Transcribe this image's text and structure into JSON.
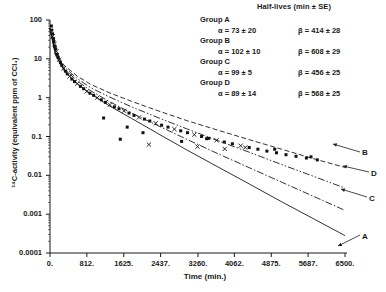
{
  "chart_data": {
    "type": "scatter",
    "title": "",
    "xlabel": "Time (min.)",
    "ylabel": "14C-activity (equivalent ppm of CCl4)",
    "ylabel_display": "¹⁴C-activity (equivalent ppm of CCl₄)",
    "yscale": "log",
    "xscale": "linear",
    "xlim": [
      0,
      6500
    ],
    "ylim": [
      0.0001,
      100
    ],
    "grid": false,
    "legend_position": "top-right",
    "xticks": [
      "0.",
      "812.",
      "1625.",
      "2437.",
      "3260.",
      "4062.",
      "4875.",
      "5687.",
      "6500."
    ],
    "xtick_values": [
      0,
      812,
      1625,
      2437,
      3260,
      4062,
      4875,
      5687,
      6500
    ],
    "yticks": [
      "100",
      "10",
      "1",
      "0.1",
      "0.01",
      "0.001",
      "0.0001"
    ],
    "ytick_values": [
      100,
      10,
      1,
      0.1,
      0.01,
      0.001,
      0.0001
    ],
    "legend_title": "Half-lives (min ± SE)",
    "groups": [
      {
        "name": "Group A",
        "curve_label": "A",
        "line_style": "solid",
        "alpha": "α = 73 ± 20",
        "beta": "β = 414 ± 28",
        "alpha_value": 73,
        "alpha_se": 20,
        "beta_value": 414,
        "beta_se": 28
      },
      {
        "name": "Group B",
        "curve_label": "B",
        "line_style": "dashed",
        "alpha": "α = 102 ± 10",
        "beta": "β = 608 ± 29",
        "alpha_value": 102,
        "alpha_se": 10,
        "beta_value": 608,
        "beta_se": 29
      },
      {
        "name": "Group C",
        "curve_label": "C",
        "line_style": "dash-dot",
        "alpha": "α = 99 ± 5",
        "beta": "β = 456 ± 25",
        "alpha_value": 99,
        "alpha_se": 5,
        "beta_value": 456,
        "beta_se": 25
      },
      {
        "name": "Group D",
        "curve_label": "D",
        "line_style": "dash-dot-dot",
        "alpha": "α = 89 ± 14",
        "beta": "β = 568 ± 25",
        "alpha_value": 89,
        "alpha_se": 14,
        "beta_value": 568,
        "beta_se": 25
      }
    ],
    "series": [
      {
        "name": "Group A fit",
        "label": "A",
        "x": [
          0,
          120,
          300,
          600,
          900,
          1300,
          1800,
          2400,
          3000,
          3700,
          4400,
          5100,
          5800,
          6500
        ],
        "y": [
          60,
          12.5,
          5.2,
          2.3,
          1.25,
          0.62,
          0.29,
          0.115,
          0.046,
          0.0165,
          0.0059,
          0.0021,
          0.00077,
          0.00028
        ]
      },
      {
        "name": "Group B fit",
        "label": "B",
        "x": [
          0,
          120,
          300,
          600,
          900,
          1300,
          1800,
          2400,
          3000,
          3700,
          4400,
          5100,
          5800,
          6500
        ],
        "y": [
          60,
          15,
          7.0,
          3.6,
          2.2,
          1.35,
          0.8,
          0.45,
          0.26,
          0.145,
          0.082,
          0.047,
          0.027,
          0.016
        ]
      },
      {
        "name": "Group C fit",
        "label": "C",
        "x": [
          0,
          120,
          300,
          600,
          900,
          1300,
          1800,
          2400,
          3000,
          3700,
          4400,
          5100,
          5800,
          6500
        ],
        "y": [
          60,
          13.5,
          5.8,
          2.7,
          1.5,
          0.8,
          0.4,
          0.185,
          0.086,
          0.036,
          0.0155,
          0.0067,
          0.0029,
          0.00125
        ]
      },
      {
        "name": "Group D fit",
        "label": "D",
        "x": [
          0,
          120,
          300,
          600,
          900,
          1300,
          1800,
          2400,
          3000,
          3700,
          4400,
          5100,
          5800,
          6500
        ],
        "y": [
          60,
          14,
          6.4,
          3.1,
          1.8,
          1.05,
          0.58,
          0.3,
          0.16,
          0.078,
          0.039,
          0.019,
          0.0095,
          0.0047
        ]
      }
    ],
    "scatter_points": [
      {
        "x": 30,
        "y": 70,
        "marker": "square"
      },
      {
        "x": 40,
        "y": 55,
        "marker": "square"
      },
      {
        "x": 55,
        "y": 44,
        "marker": "square"
      },
      {
        "x": 60,
        "y": 38,
        "marker": "cross"
      },
      {
        "x": 75,
        "y": 33,
        "marker": "square"
      },
      {
        "x": 85,
        "y": 28,
        "marker": "square"
      },
      {
        "x": 100,
        "y": 24,
        "marker": "cross"
      },
      {
        "x": 110,
        "y": 21,
        "marker": "square"
      },
      {
        "x": 125,
        "y": 18,
        "marker": "square"
      },
      {
        "x": 140,
        "y": 15.5,
        "marker": "cross"
      },
      {
        "x": 160,
        "y": 13,
        "marker": "square"
      },
      {
        "x": 180,
        "y": 11,
        "marker": "square"
      },
      {
        "x": 200,
        "y": 9.5,
        "marker": "cross"
      },
      {
        "x": 230,
        "y": 8.0,
        "marker": "square"
      },
      {
        "x": 260,
        "y": 6.8,
        "marker": "square"
      },
      {
        "x": 300,
        "y": 5.6,
        "marker": "cross"
      },
      {
        "x": 340,
        "y": 4.8,
        "marker": "square"
      },
      {
        "x": 380,
        "y": 4.1,
        "marker": "square"
      },
      {
        "x": 430,
        "y": 3.5,
        "marker": "cross"
      },
      {
        "x": 480,
        "y": 3.0,
        "marker": "square"
      },
      {
        "x": 540,
        "y": 2.6,
        "marker": "square"
      },
      {
        "x": 600,
        "y": 2.3,
        "marker": "cross"
      },
      {
        "x": 670,
        "y": 1.95,
        "marker": "square"
      },
      {
        "x": 740,
        "y": 1.7,
        "marker": "square"
      },
      {
        "x": 810,
        "y": 1.45,
        "marker": "cross"
      },
      {
        "x": 880,
        "y": 1.3,
        "marker": "square"
      },
      {
        "x": 960,
        "y": 1.15,
        "marker": "square"
      },
      {
        "x": 1040,
        "y": 1.0,
        "marker": "cross"
      },
      {
        "x": 1130,
        "y": 0.88,
        "marker": "square"
      },
      {
        "x": 1220,
        "y": 0.76,
        "marker": "square"
      },
      {
        "x": 1320,
        "y": 0.66,
        "marker": "cross"
      },
      {
        "x": 1420,
        "y": 0.58,
        "marker": "square"
      },
      {
        "x": 1520,
        "y": 0.52,
        "marker": "square"
      },
      {
        "x": 1630,
        "y": 0.46,
        "marker": "cross"
      },
      {
        "x": 1740,
        "y": 0.4,
        "marker": "square"
      },
      {
        "x": 1850,
        "y": 0.35,
        "marker": "square"
      },
      {
        "x": 1960,
        "y": 0.31,
        "marker": "cross"
      },
      {
        "x": 2080,
        "y": 0.28,
        "marker": "square"
      },
      {
        "x": 2200,
        "y": 0.25,
        "marker": "square"
      },
      {
        "x": 2330,
        "y": 0.22,
        "marker": "cross"
      },
      {
        "x": 2460,
        "y": 0.195,
        "marker": "square"
      },
      {
        "x": 2600,
        "y": 0.175,
        "marker": "square"
      },
      {
        "x": 2740,
        "y": 0.155,
        "marker": "cross"
      },
      {
        "x": 2880,
        "y": 0.14,
        "marker": "square"
      },
      {
        "x": 3030,
        "y": 0.125,
        "marker": "square"
      },
      {
        "x": 3180,
        "y": 0.112,
        "marker": "cross"
      },
      {
        "x": 3340,
        "y": 0.1,
        "marker": "square"
      },
      {
        "x": 3500,
        "y": 0.09,
        "marker": "square"
      },
      {
        "x": 3670,
        "y": 0.08,
        "marker": "cross"
      },
      {
        "x": 3840,
        "y": 0.072,
        "marker": "square"
      },
      {
        "x": 4020,
        "y": 0.065,
        "marker": "square"
      },
      {
        "x": 4200,
        "y": 0.058,
        "marker": "cross"
      },
      {
        "x": 4390,
        "y": 0.052,
        "marker": "square"
      },
      {
        "x": 4580,
        "y": 0.047,
        "marker": "square"
      },
      {
        "x": 4780,
        "y": 0.042,
        "marker": "square"
      },
      {
        "x": 4990,
        "y": 0.038,
        "marker": "square"
      },
      {
        "x": 5200,
        "y": 0.034,
        "marker": "square"
      },
      {
        "x": 5420,
        "y": 0.031,
        "marker": "square"
      },
      {
        "x": 5650,
        "y": 0.028,
        "marker": "square"
      },
      {
        "x": 5890,
        "y": 0.025,
        "marker": "square"
      },
      {
        "x": 2180,
        "y": 0.062,
        "marker": "cross"
      },
      {
        "x": 1550,
        "y": 0.085,
        "marker": "square"
      },
      {
        "x": 3250,
        "y": 0.055,
        "marker": "cross"
      },
      {
        "x": 3850,
        "y": 0.048,
        "marker": "cross"
      },
      {
        "x": 4300,
        "y": 0.052,
        "marker": "cross"
      },
      {
        "x": 4950,
        "y": 0.047,
        "marker": "square"
      },
      {
        "x": 5750,
        "y": 0.03,
        "marker": "square"
      },
      {
        "x": 2900,
        "y": 0.075,
        "marker": "square"
      },
      {
        "x": 2050,
        "y": 0.125,
        "marker": "square"
      },
      {
        "x": 1180,
        "y": 0.3,
        "marker": "square"
      },
      {
        "x": 1700,
        "y": 0.175,
        "marker": "square"
      },
      {
        "x": 3450,
        "y": 0.088,
        "marker": "square"
      }
    ]
  }
}
